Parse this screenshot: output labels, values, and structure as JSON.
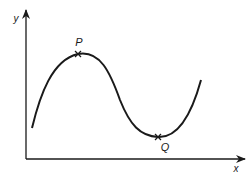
{
  "diagram": {
    "axes": {
      "x_label": "x",
      "y_label": "y"
    },
    "points": [
      {
        "label": "P",
        "description": "local maximum",
        "marker": "x"
      },
      {
        "label": "Q",
        "description": "local minimum",
        "marker": "x"
      }
    ],
    "colors": {
      "stroke": "#1a1a1a",
      "background": "#ffffff"
    }
  }
}
